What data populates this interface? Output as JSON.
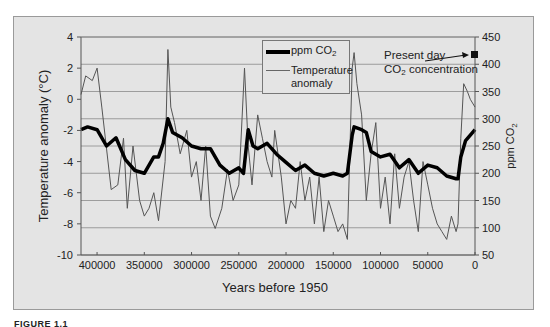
{
  "figure": {
    "caption": "FIGURE 1.1"
  },
  "chart_data": {
    "type": "line",
    "title": "",
    "xlabel": "Years before 1950",
    "ylabel_left": "Temperature anomaly (°C)",
    "ylabel_right": "ppm CO2",
    "x_reversed": true,
    "xlim": [
      417000,
      0
    ],
    "ylim_left": [
      -10,
      4
    ],
    "ylim_right": [
      50,
      450
    ],
    "x_ticks": [
      "400000",
      "350000",
      "300000",
      "250000",
      "200000",
      "150000",
      "100000",
      "50000",
      "0"
    ],
    "y_ticks_left": [
      "4",
      "2",
      "0",
      "-2",
      "-4",
      "-6",
      "-8",
      "-10"
    ],
    "y_ticks_right": [
      "450",
      "400",
      "350",
      "300",
      "250",
      "200",
      "150",
      "100",
      "50"
    ],
    "grid": "horizontal (right-axis CO2 gridlines)",
    "legend": {
      "position": "upper center",
      "entries": [
        "ppm CO2",
        "Temperature anomaly"
      ]
    },
    "annotations": [
      {
        "text": "Present day CO2 concentration",
        "x": 0,
        "y_right": 415,
        "marker": "square",
        "arrow": true
      }
    ],
    "series": [
      {
        "name": "ppm CO2",
        "axis": "right",
        "style": "thick black line",
        "x": [
          417000,
          410000,
          400000,
          390000,
          380000,
          370000,
          360000,
          350000,
          340000,
          335000,
          330000,
          325000,
          320000,
          310000,
          300000,
          290000,
          280000,
          270000,
          260000,
          250000,
          245000,
          240000,
          235000,
          230000,
          220000,
          210000,
          200000,
          190000,
          180000,
          170000,
          160000,
          150000,
          140000,
          135000,
          130000,
          128000,
          120000,
          115000,
          110000,
          100000,
          90000,
          80000,
          70000,
          60000,
          50000,
          40000,
          30000,
          20000,
          18000,
          15000,
          10000,
          5000,
          0
        ],
        "values": [
          280,
          285,
          280,
          250,
          265,
          225,
          205,
          200,
          230,
          230,
          255,
          300,
          275,
          265,
          250,
          245,
          245,
          215,
          200,
          210,
          200,
          280,
          250,
          245,
          255,
          235,
          220,
          205,
          215,
          200,
          195,
          200,
          195,
          200,
          270,
          285,
          280,
          275,
          240,
          230,
          235,
          210,
          225,
          200,
          215,
          210,
          195,
          190,
          190,
          230,
          260,
          270,
          280
        ]
      },
      {
        "name": "Temperature anomaly",
        "axis": "left",
        "style": "thin gray line",
        "x": [
          417000,
          412000,
          405000,
          400000,
          395000,
          385000,
          378000,
          372000,
          368000,
          362000,
          355000,
          350000,
          345000,
          340000,
          335000,
          328000,
          325000,
          322000,
          318000,
          312000,
          305000,
          300000,
          295000,
          290000,
          285000,
          280000,
          275000,
          268000,
          262000,
          256000,
          250000,
          244000,
          240000,
          236000,
          230000,
          225000,
          220000,
          215000,
          212000,
          205000,
          200000,
          195000,
          190000,
          185000,
          180000,
          175000,
          170000,
          165000,
          160000,
          155000,
          150000,
          145000,
          140000,
          135000,
          130000,
          128000,
          125000,
          120000,
          115000,
          110000,
          105000,
          100000,
          95000,
          90000,
          85000,
          80000,
          75000,
          70000,
          65000,
          60000,
          55000,
          50000,
          45000,
          40000,
          35000,
          30000,
          25000,
          20000,
          18000,
          15000,
          12000,
          8000,
          5000,
          0
        ],
        "values": [
          0.3,
          1.5,
          1.2,
          2.0,
          -0.5,
          -5.8,
          -5.5,
          -2.5,
          -7.0,
          -3.0,
          -6.5,
          -7.5,
          -7.0,
          -6.0,
          -7.8,
          -4.0,
          3.2,
          -0.5,
          -1.5,
          -3.5,
          -2.0,
          -5.0,
          -4.0,
          -6.5,
          -3.0,
          -7.5,
          -8.3,
          -7.0,
          -4.5,
          -6.5,
          -5.5,
          2.0,
          -3.0,
          -5.5,
          -1.0,
          -2.5,
          -4.0,
          -5.0,
          -2.0,
          -5.0,
          -8.0,
          -6.5,
          -7.0,
          -4.0,
          -6.5,
          -5.0,
          -8.0,
          -5.0,
          -8.5,
          -6.5,
          -7.5,
          -8.5,
          -8.0,
          -9.0,
          2.0,
          3.0,
          1.0,
          -1.0,
          -6.5,
          -3.5,
          -1.5,
          -7.0,
          -5.0,
          -8.0,
          -3.5,
          -7.0,
          -5.0,
          -4.0,
          -6.5,
          -8.5,
          -4.0,
          -5.5,
          -7.0,
          -8.0,
          -8.5,
          -9.0,
          -7.5,
          -8.5,
          -8.0,
          -2.5,
          1.0,
          0.5,
          0.0,
          -0.5
        ]
      }
    ]
  },
  "axes": {
    "xlabel": "Years before 1950",
    "ylabel_left": "Temperature anomaly (°C)",
    "ylabel_right_main": "ppm CO",
    "ylabel_right_sub": "2",
    "x_ticks": [
      "400000",
      "350000",
      "300000",
      "250000",
      "200000",
      "150000",
      "100000",
      "50000",
      "0"
    ],
    "y_ticks_left": [
      "4",
      "2",
      "0",
      "-2",
      "-4",
      "-6",
      "-8",
      "-10"
    ],
    "y_ticks_right": [
      "450",
      "400",
      "350",
      "300",
      "250",
      "200",
      "150",
      "100",
      "50"
    ]
  },
  "legend": {
    "co2_main": "ppm CO",
    "co2_sub": "2",
    "temp_line1": "Temperature",
    "temp_line2": "anomaly"
  },
  "annotation": {
    "line1": "Present day",
    "line2_main": "CO",
    "line2_sub": "2",
    "line2_rest": " concentration"
  },
  "colors": {
    "background": "#e4e4e4",
    "co2_line": "#000000",
    "temp_line": "#555555",
    "grid": "#8a8a8a"
  }
}
